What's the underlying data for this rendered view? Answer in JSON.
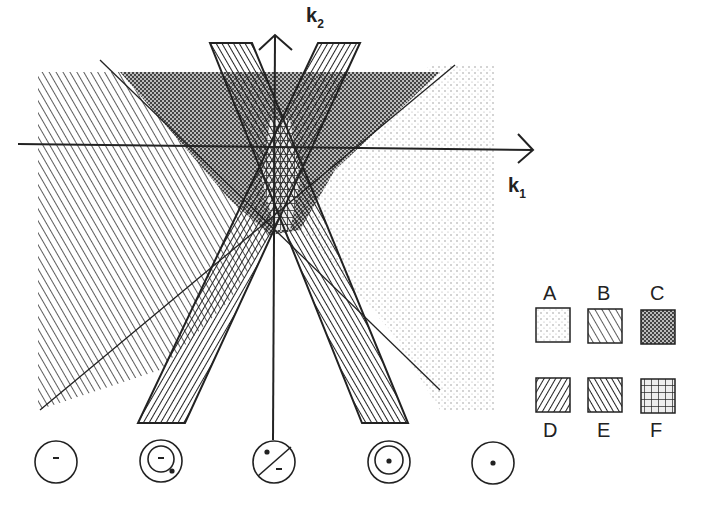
{
  "axes": {
    "k1_label": "k",
    "k1_sub": "1",
    "k2_label": "k",
    "k2_sub": "2"
  },
  "legend": {
    "items": [
      {
        "key": "A",
        "pattern": "dots-sparse"
      },
      {
        "key": "B",
        "pattern": "hatch-backslash-wide"
      },
      {
        "key": "C",
        "pattern": "crosshatch-dense"
      },
      {
        "key": "D",
        "pattern": "hatch-slash-dense"
      },
      {
        "key": "E",
        "pattern": "hatch-backslash-dense"
      },
      {
        "key": "F",
        "pattern": "grid"
      }
    ]
  },
  "circle_icons": [
    {
      "id": "c1",
      "inner": "none",
      "sign": "-"
    },
    {
      "id": "c2",
      "inner": "ring",
      "sign": "-"
    },
    {
      "id": "c3",
      "inner": "split",
      "sign_top": "+",
      "sign_bottom": "-"
    },
    {
      "id": "c4",
      "inner": "ring",
      "sign": "+"
    },
    {
      "id": "c5",
      "inner": "none",
      "sign": "+"
    }
  ],
  "colors": {
    "ink": "#222222",
    "background": "#ffffff"
  }
}
